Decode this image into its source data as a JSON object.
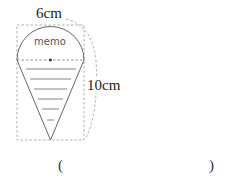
{
  "diagram": {
    "width_label": "6cm",
    "height_label": "10cm",
    "memo_text": "memo",
    "answer_open": "(",
    "answer_close": ")",
    "colors": {
      "stroke": "#555555",
      "dashed": "#888888"
    }
  }
}
